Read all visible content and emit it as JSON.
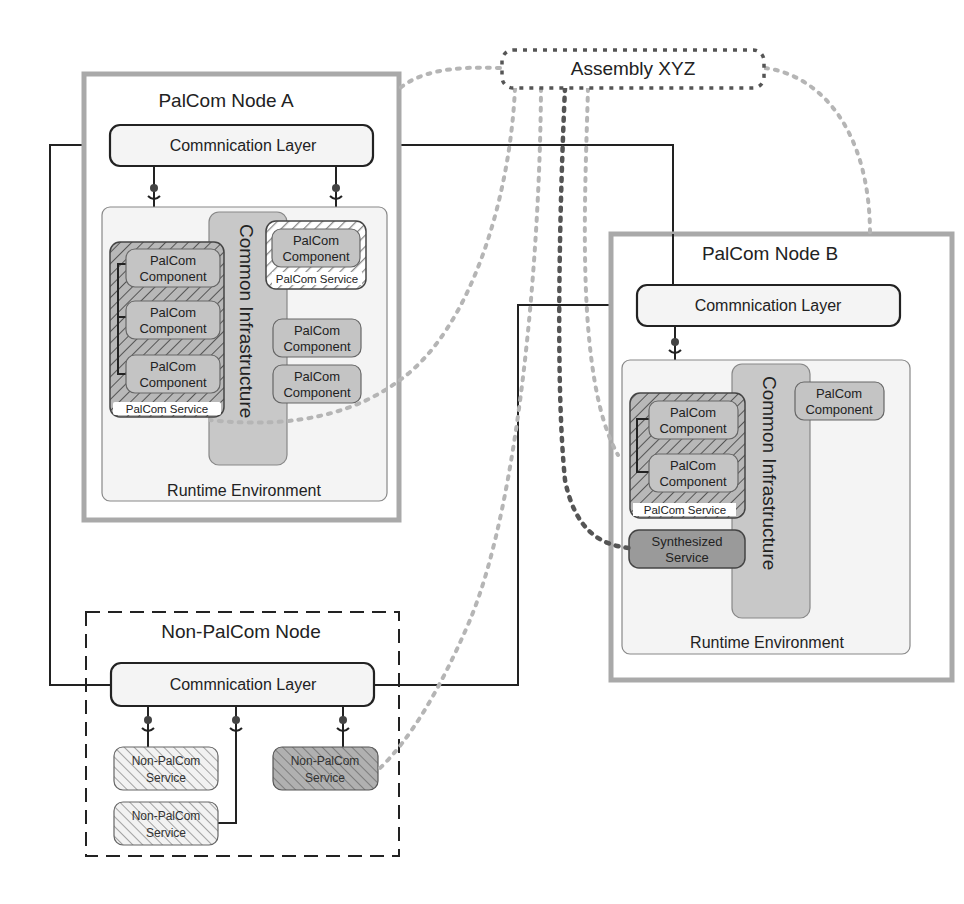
{
  "assembly": {
    "label": "Assembly XYZ"
  },
  "node_a": {
    "title": "PalCom Node A",
    "comm_layer": "Commnication Layer",
    "runtime_label": "Runtime Environment",
    "infrastructure_label": "Common Infrastructure",
    "service_left": {
      "label": "PalCom Service",
      "components": [
        "PalCom Component",
        "PalCom Component",
        "PalCom Component"
      ]
    },
    "service_right": {
      "label": "PalCom Service",
      "components": [
        "PalCom Component"
      ]
    },
    "loose_components": [
      "PalCom Component",
      "PalCom Component"
    ]
  },
  "node_b": {
    "title": "PalCom Node B",
    "comm_layer": "Commnication Layer",
    "runtime_label": "Runtime Environment",
    "infrastructure_label": "Common Infrastructure",
    "service": {
      "label": "PalCom Service",
      "components": [
        "PalCom Component",
        "PalCom Component"
      ]
    },
    "loose_components": [
      "PalCom Component"
    ],
    "synthesized_service": [
      "Synthesized",
      "Service"
    ]
  },
  "non_palcom_node": {
    "title": "Non-PalCom Node",
    "comm_layer": "Commnication Layer",
    "services": [
      [
        "Non-PalCom",
        "Service"
      ],
      [
        "Non-PalCom",
        "Service"
      ],
      [
        "Non-PalCom",
        "Service"
      ]
    ]
  },
  "component_word": [
    "PalCom",
    "Component"
  ],
  "colors": {
    "node_border": "#a9a9a9",
    "runtime_fill": "#f4f4f4",
    "component_fill": "#c4c4c4",
    "infra_fill": "#c8c8c8",
    "synth_fill": "#9a9a9a",
    "assembly_link": "#b5b5b5",
    "assembly_link_dark": "#555555"
  }
}
